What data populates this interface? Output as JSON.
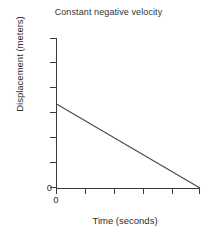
{
  "chart_data": {
    "type": "line",
    "title": "Constant negative velocity",
    "xlabel": "Time (seconds)",
    "ylabel": "Displacement (meters)",
    "x": [
      0,
      6
    ],
    "y": [
      5.6,
      0
    ],
    "series": [
      {
        "name": "displacement",
        "x": [
          0,
          6
        ],
        "values": [
          5.6,
          0
        ]
      }
    ],
    "xlim": [
      0,
      6
    ],
    "ylim": [
      0,
      10
    ],
    "xticks": [
      0,
      1,
      2,
      3,
      4,
      5
    ],
    "yticks": [
      0,
      1,
      2,
      3,
      4,
      5,
      6
    ],
    "xtick_labels": [
      "0",
      "",
      "",
      "",
      "",
      ""
    ],
    "ytick_labels": [
      "0",
      "",
      "",
      "",
      "",
      "",
      ""
    ],
    "grid": false,
    "legend": false,
    "line_color": "#4d4d4d",
    "axis_color": "#3a3a3a"
  },
  "labels": {
    "title": "Constant negative velocity",
    "x_axis": "Time (seconds)",
    "y_axis": "Displacement (meters)",
    "y_origin": "0",
    "x_origin": "0"
  }
}
